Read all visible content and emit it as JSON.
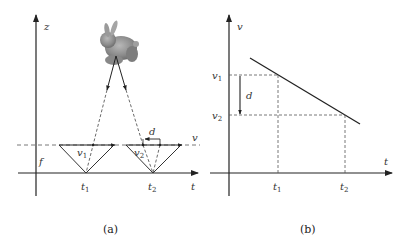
{
  "panel_a": {
    "caption": "(a)",
    "axis_vertical_label": "z",
    "axis_horizontal_label": "t",
    "dashed_line_label": "v",
    "focal_label": "f",
    "object": "bunny",
    "camera_1": {
      "time_label": "t",
      "time_sub": "1",
      "v_label": "v",
      "v_sub": "1"
    },
    "camera_2": {
      "time_label": "t",
      "time_sub": "2",
      "v_label": "v",
      "v_sub": "2"
    },
    "disparity_label": "d"
  },
  "panel_b": {
    "caption": "(b)",
    "axis_vertical_label": "v",
    "axis_horizontal_label": "t",
    "v1_label": "v",
    "v1_sub": "1",
    "v2_label": "v",
    "v2_sub": "2",
    "t1_label": "t",
    "t1_sub": "1",
    "t2_label": "t",
    "t2_sub": "2",
    "disparity_label": "d"
  }
}
